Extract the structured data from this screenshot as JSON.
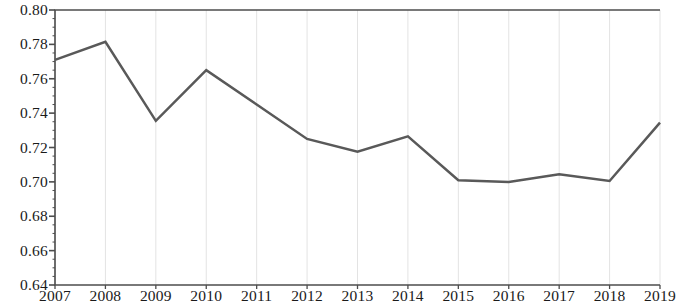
{
  "chart_data": {
    "type": "line",
    "title": "",
    "subtitle": "",
    "xlabel": "",
    "ylabel": "",
    "categories": [
      "2007",
      "2008",
      "2009",
      "2010",
      "2011",
      "2012",
      "2013",
      "2014",
      "2015",
      "2016",
      "2017",
      "2018",
      "2019"
    ],
    "values": [
      0.771,
      0.7815,
      0.7355,
      0.765,
      0.745,
      0.725,
      0.7175,
      0.7265,
      0.701,
      0.7,
      0.7045,
      0.7005,
      0.7345
    ],
    "series": [
      {
        "name": "",
        "values": [
          0.771,
          0.7815,
          0.7355,
          0.765,
          0.745,
          0.725,
          0.7175,
          0.7265,
          0.701,
          0.7,
          0.7045,
          0.7005,
          0.7345
        ]
      }
    ],
    "ylim": [
      0.64,
      0.8
    ],
    "ytick_step": 0.02,
    "ytick_labels": [
      "0.80",
      "0.78",
      "0.76",
      "0.74",
      "0.72",
      "0.70",
      "0.68",
      "0.66",
      "0.64"
    ],
    "ytick_values": [
      0.8,
      0.78,
      0.76,
      0.74,
      0.72,
      0.7,
      0.68,
      0.66,
      0.64
    ],
    "xtick_labels": [
      "2007",
      "2008",
      "2009",
      "2010",
      "2011",
      "2012",
      "2013",
      "2014",
      "2015",
      "2016",
      "2017",
      "2018",
      "2019"
    ],
    "grid": {
      "vertical": true,
      "horizontal": false,
      "color": "#e3e3e3"
    },
    "legend": {
      "visible": false,
      "position": "none",
      "entries": []
    },
    "markers": false,
    "line_color": "#595959",
    "line_width": 2.5,
    "axis_color": "#4d4d4d",
    "minor_ticks": true,
    "annotations": []
  }
}
